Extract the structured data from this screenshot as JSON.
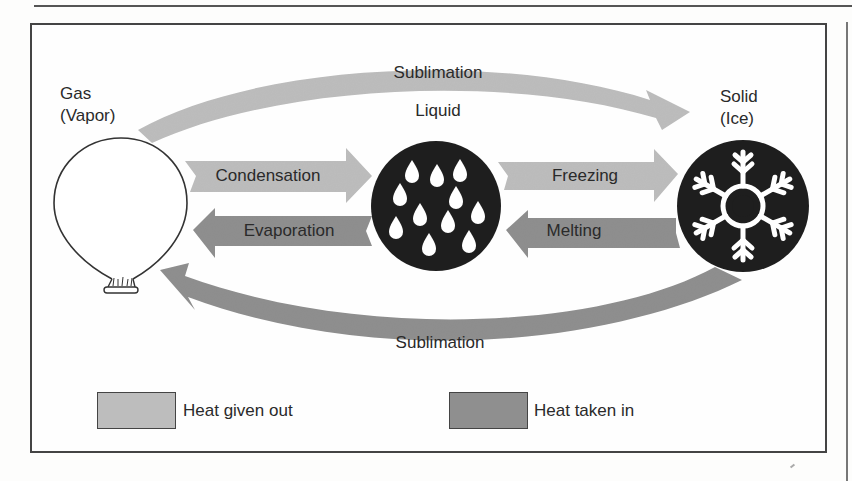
{
  "diagram": {
    "colors": {
      "heat_given_out": "#bdbdbd",
      "heat_taken_in": "#8f8f8f",
      "state_circle_fill": "#1e1e1e",
      "gas_outline": "#333333",
      "frame": "#444444"
    },
    "states": {
      "gas": {
        "label_line1": "Gas",
        "label_line2": "(Vapor)",
        "icon": "balloon-icon"
      },
      "liquid": {
        "label": "Liquid",
        "icon": "water-drops-icon",
        "drop_count": 12
      },
      "solid": {
        "label_line1": "Solid",
        "label_line2": "(Ice)",
        "icon": "snowflake-icon"
      }
    },
    "transitions": [
      {
        "label": "Sublimation",
        "from": "Gas",
        "to": "Solid",
        "position": "top arc",
        "heat": "given out"
      },
      {
        "label": "Condensation",
        "from": "Gas",
        "to": "Liquid",
        "heat": "given out"
      },
      {
        "label": "Evaporation",
        "from": "Liquid",
        "to": "Gas",
        "heat": "taken in"
      },
      {
        "label": "Freezing",
        "from": "Liquid",
        "to": "Solid",
        "heat": "given out"
      },
      {
        "label": "Melting",
        "from": "Solid",
        "to": "Liquid",
        "heat": "taken in"
      },
      {
        "label": "Sublimation",
        "from": "Solid",
        "to": "Gas",
        "position": "bottom arc",
        "heat": "taken in"
      }
    ],
    "legend": [
      {
        "label": "Heat given out",
        "color": "#bdbdbd"
      },
      {
        "label": "Heat taken in",
        "color": "#8f8f8f"
      }
    ]
  }
}
